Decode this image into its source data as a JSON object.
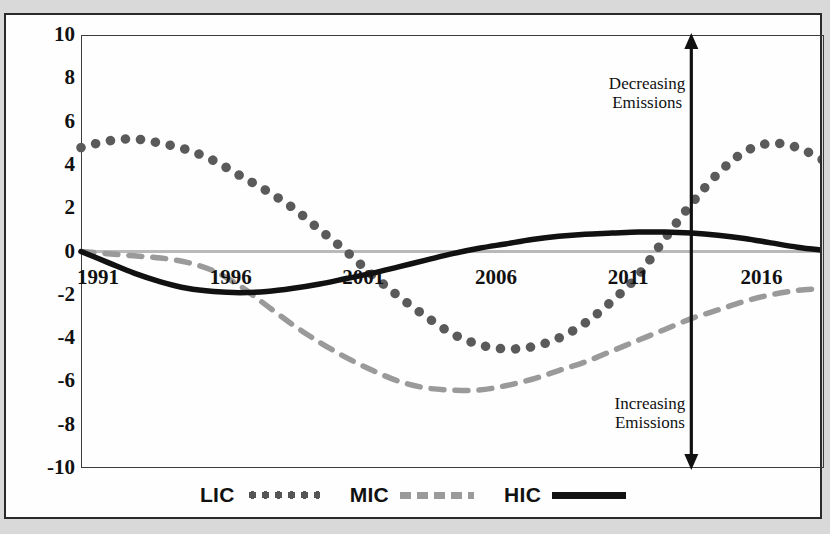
{
  "figure": {
    "annotation_top": [
      "Decreasing",
      "Emissions"
    ],
    "annotation_bottom": [
      "Increasing",
      "Emissions"
    ],
    "axis_arrow": "vertical-double-arrow"
  },
  "legend": {
    "position": "bottom-center",
    "items": [
      {
        "label": "LIC",
        "style": "dotted",
        "color": "#5a5a5a"
      },
      {
        "label": "MIC",
        "style": "dashed",
        "color": "#9a9a9a"
      },
      {
        "label": "HIC",
        "style": "solid",
        "color": "#111111"
      }
    ]
  },
  "chart_data": {
    "type": "line",
    "title": "",
    "subtitle": "",
    "xlabel": "",
    "ylabel": "",
    "xlim": [
      1991,
      2019
    ],
    "ylim": [
      -10,
      10
    ],
    "grid": false,
    "zero_line": true,
    "zero_line_color": "#b9b9b9",
    "legend_position": "bottom-center",
    "yticks": [
      10,
      8,
      6,
      4,
      2,
      0,
      -2,
      -4,
      -6,
      -8,
      -10
    ],
    "ytick_labels": [
      "10",
      "8",
      "6",
      "4",
      "2",
      "0",
      "-2",
      "-4",
      "-6",
      "-8",
      "-10"
    ],
    "xticks": [
      1991,
      1996,
      2001,
      2006,
      2011,
      2016
    ],
    "xtick_labels": [
      "1991",
      "1996",
      "2001",
      "2006",
      "2011",
      "2016"
    ],
    "x": [
      1991,
      1992,
      1993,
      1994,
      1995,
      1996,
      1997,
      1998,
      1999,
      2000,
      2001,
      2002,
      2003,
      2004,
      2005,
      2006,
      2007,
      2008,
      2009,
      2010,
      2011,
      2012,
      2013,
      2014,
      2015,
      2016,
      2017,
      2018,
      2019
    ],
    "series": [
      {
        "name": "LIC",
        "style": "dotted",
        "color": "#5a5a5a",
        "values": [
          4.8,
          5.1,
          5.2,
          5.0,
          4.7,
          4.2,
          3.5,
          2.8,
          2.0,
          1.0,
          0.0,
          -1.1,
          -2.1,
          -3.0,
          -3.8,
          -4.3,
          -4.5,
          -4.4,
          -4.0,
          -3.3,
          -2.3,
          -1.1,
          0.6,
          2.2,
          3.6,
          4.6,
          5.0,
          4.8,
          4.2
        ]
      },
      {
        "name": "MIC",
        "style": "dashed",
        "color": "#9a9a9a",
        "values": [
          0.0,
          -0.1,
          -0.2,
          -0.3,
          -0.5,
          -0.9,
          -1.6,
          -2.5,
          -3.4,
          -4.2,
          -4.9,
          -5.5,
          -6.0,
          -6.3,
          -6.4,
          -6.4,
          -6.2,
          -5.9,
          -5.5,
          -5.1,
          -4.6,
          -4.1,
          -3.6,
          -3.1,
          -2.7,
          -2.3,
          -2.0,
          -1.8,
          -1.7
        ]
      },
      {
        "name": "HIC",
        "style": "solid",
        "color": "#111111",
        "values": [
          0.0,
          -0.5,
          -1.0,
          -1.4,
          -1.7,
          -1.85,
          -1.9,
          -1.85,
          -1.7,
          -1.5,
          -1.25,
          -1.0,
          -0.7,
          -0.4,
          -0.1,
          0.15,
          0.35,
          0.55,
          0.7,
          0.8,
          0.85,
          0.9,
          0.9,
          0.85,
          0.75,
          0.6,
          0.4,
          0.2,
          0.05
        ]
      }
    ],
    "annotations": [
      {
        "text": "Decreasing Emissions",
        "x": 2014,
        "y": 7.5,
        "align": "right"
      },
      {
        "text": "Increasing Emissions",
        "x": 2014,
        "y": -7.5,
        "align": "right"
      }
    ]
  }
}
